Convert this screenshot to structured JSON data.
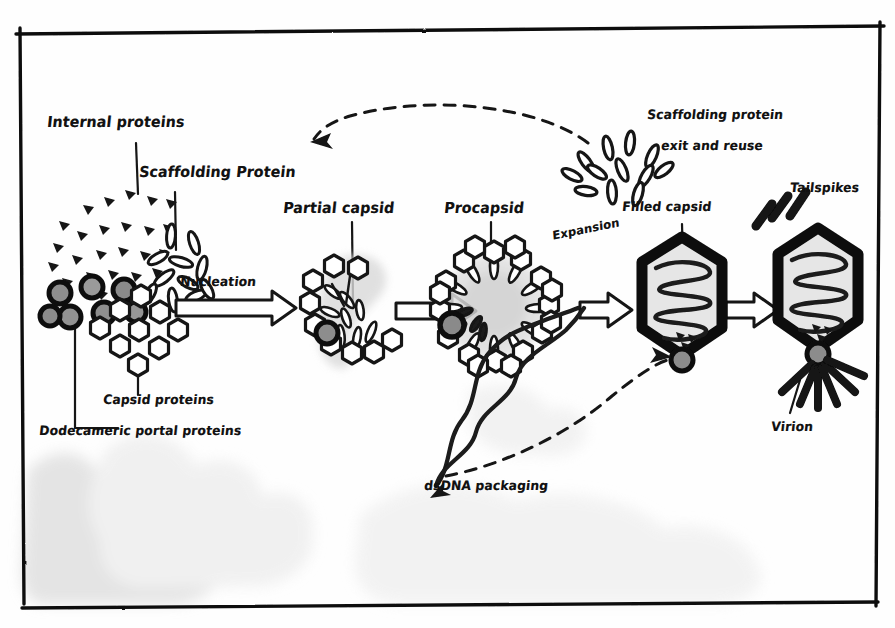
{
  "figure": {
    "type": "diagram",
    "style": "hand-drawn ink sketch with grey watercolor wash, enclosed in a hand-drawn rectangular border",
    "background_color": "#fefefe",
    "ink_color": "#111111",
    "wash_color": "#e9e9e9"
  },
  "labels": {
    "internal_proteins": "Internal proteins",
    "scaffolding_protein": "Scaffolding Protein",
    "nucleation": "Nucleation",
    "capsid_proteins": "Capsid proteins",
    "dodecameric_portal_proteins": "Dodecameric portal proteins",
    "partial_capsid": "Partial capsid",
    "procapsid": "Procapsid",
    "expansion": "Expansion",
    "scaffolding_exit_line1": "Scaffolding protein",
    "scaffolding_exit_line2": "exit and reuse",
    "filled_capsid": "Filled capsid",
    "tailspikes": "Tailspikes",
    "virion": "Virion",
    "dsdna_packaging": "dsDNA packaging"
  },
  "stages": [
    {
      "id": "building-blocks",
      "name": "Free subunits",
      "labels": [
        "Internal proteins",
        "Scaffolding Protein",
        "Capsid proteins",
        "Dodecameric portal proteins"
      ]
    },
    {
      "id": "partial-capsid",
      "name": "Partial capsid",
      "labels": [
        "Partial capsid"
      ]
    },
    {
      "id": "procapsid",
      "name": "Procapsid",
      "labels": [
        "Procapsid"
      ]
    },
    {
      "id": "filled-capsid",
      "name": "Filled capsid",
      "labels": [
        "Filled capsid"
      ]
    },
    {
      "id": "virion",
      "name": "Virion",
      "labels": [
        "Virion",
        "Tailspikes"
      ]
    }
  ],
  "transitions": [
    {
      "id": "nucleation-arrow",
      "label": "Nucleation",
      "kind": "block-arrow",
      "from": "building-blocks",
      "to": "partial-capsid"
    },
    {
      "id": "growth-arrow",
      "label": "",
      "kind": "block-arrow",
      "from": "partial-capsid",
      "to": "procapsid"
    },
    {
      "id": "expansion-arrow",
      "label": "Expansion",
      "kind": "block-arrow",
      "from": "procapsid",
      "to": "filled-capsid"
    },
    {
      "id": "maturation-arrow",
      "label": "",
      "kind": "block-arrow",
      "from": "filled-capsid",
      "to": "virion"
    },
    {
      "id": "scaffolding-recycle-arrow",
      "label": "Scaffolding protein exit and reuse",
      "kind": "dashed-curve",
      "from": "filled-capsid",
      "to": "scaffolding-protein-pool"
    },
    {
      "id": "dsdna-packaging-arrow",
      "label": "dsDNA packaging",
      "kind": "dashed-curve",
      "from": "dsDNA",
      "to": "filled-capsid"
    }
  ],
  "glyph_counts": {
    "internal_protein_triangles": 26,
    "scaffolding_protein_ellipses_left": 11,
    "scaffolding_protein_ellipses_exit": 12,
    "capsid_protein_hexagons": 9,
    "portal_protein_circles": 7,
    "tailspikes_free": 3,
    "tailspikes_attached": 6
  }
}
